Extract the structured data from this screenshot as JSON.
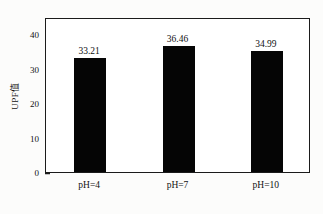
{
  "chart_data": {
    "type": "bar",
    "title": "",
    "subtitle": "",
    "xlabel": "",
    "ylabel": "UPF值",
    "categories": [
      "pH=4",
      "pH=7",
      "pH=10"
    ],
    "values": [
      33.21,
      36.46,
      34.99
    ],
    "data_labels": [
      "33.21",
      "36.46",
      "34.99"
    ],
    "ylim": [
      0,
      45
    ],
    "yticks": [
      0,
      10,
      20,
      30,
      40
    ],
    "ytick_labels": [
      "0",
      "10",
      "20",
      "30",
      "40"
    ],
    "grid": false,
    "legend": null,
    "legend_position": "none",
    "bar_color": "#050505",
    "frame_color": "#1b1b1b",
    "background_color": "#ffffff",
    "text_color": "#111111"
  }
}
